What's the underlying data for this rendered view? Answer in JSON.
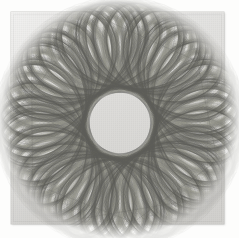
{
  "image": {
    "kind": "scanned-drawing",
    "subject": "spirograph-rosette",
    "title": "Spirograph rosette drawing on paper",
    "description": "Pencil spirograph (hypotrochoid) rosette forming a lobed annular mesh with an empty circular centre, drawn on a square sheet of off-white paper.",
    "canvas": {
      "width": 239,
      "height": 238
    },
    "background_color": "#fdfdfc"
  },
  "paper": {
    "label": "paper sheet",
    "color": "#dddcd9",
    "edge_color": "#aaaaa6",
    "x": 11,
    "y": 12,
    "width": 213,
    "height": 212
  },
  "drawing": {
    "label": "spirograph rosette",
    "ink_color": "#6f6f6d",
    "ink_color_light": "#97978f",
    "center_x": 120,
    "center_y": 123,
    "outer_radius": 90,
    "inner_radius": 45,
    "lobes": 8,
    "curve_count": 96,
    "stroke_width": 0.45
  },
  "chart_data": {
    "type": "line",
    "xlabel": "",
    "ylabel": "",
    "note": "Two interleaved families of rotated hypotrochoid curves generating a diamond lattice annulus.",
    "parameters": {
      "R": 90,
      "r": 22.5,
      "d": 45,
      "rotations": 96,
      "rotation_step_degrees": 3.75,
      "lobes": 8
    },
    "series": [
      {
        "name": "family-a",
        "count": 48,
        "phase_degrees": 0,
        "direction": "clockwise"
      },
      {
        "name": "family-b",
        "count": 48,
        "phase_degrees": 1.875,
        "direction": "counter-clockwise"
      }
    ]
  }
}
